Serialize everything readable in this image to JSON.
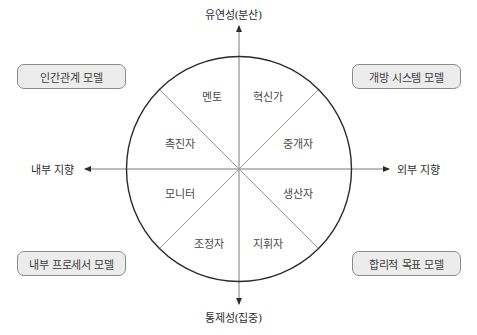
{
  "diagram": {
    "axes": {
      "top": "유연성(분산)",
      "bottom": "통제성(집중)",
      "left": "내부 지향",
      "right": "외부 지향"
    },
    "models": {
      "top_left": "인간관계 모델",
      "top_right": "개방 시스템 모델",
      "bottom_left": "내부 프로세서 모델",
      "bottom_right": "합리적 목표 모델"
    },
    "roles": [
      {
        "label": "멘토",
        "sector": "upper-left-top"
      },
      {
        "label": "혁신가",
        "sector": "upper-right-top"
      },
      {
        "label": "촉진자",
        "sector": "upper-left-side"
      },
      {
        "label": "중개자",
        "sector": "upper-right-side"
      },
      {
        "label": "모니터",
        "sector": "lower-left-side"
      },
      {
        "label": "생산자",
        "sector": "lower-right-side"
      },
      {
        "label": "조정자",
        "sector": "lower-left-bottom"
      },
      {
        "label": "지휘자",
        "sector": "lower-right-bottom"
      }
    ],
    "colors": {
      "circle_stroke": "#2b2b2b",
      "axis_stroke": "#7a7a7a",
      "divider_stroke": "#9a9a9a",
      "box_fill": "#ececec",
      "box_border": "#8c8c8c"
    }
  }
}
